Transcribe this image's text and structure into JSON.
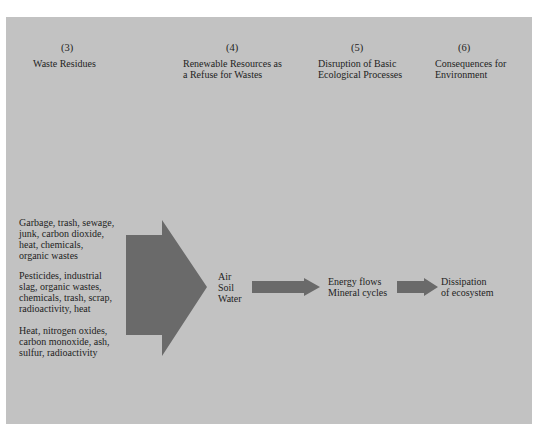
{
  "columns": [
    {
      "number": "(3)",
      "title_lines": [
        "Waste Residues"
      ]
    },
    {
      "number": "(4)",
      "title_lines": [
        "Renewable Resources as",
        "a Refuse for Wastes"
      ]
    },
    {
      "number": "(5)",
      "title_lines": [
        "Disruption of Basic",
        "Ecological Processes"
      ]
    },
    {
      "number": "(6)",
      "title_lines": [
        "Consequences for",
        "Environment"
      ]
    }
  ],
  "waste_groups": [
    "Garbage, trash, sewage,\njunk, carbon dioxide,\nheat, chemicals,\norganic wastes",
    "Pesticides, industrial\nslag, organic wastes,\nchemicals, trash, scrap,\nradioactivity, heat",
    "Heat, nitrogen oxides,\ncarbon monoxide, ash,\nsulfur, radioactivity"
  ],
  "resources": "Air\nSoil\nWater",
  "processes": "Energy flows\nMineral cycles",
  "consequence": "Dissipation\nof ecosystem",
  "colors": {
    "panel": "#c2c2c2",
    "arrow": "#6a6a6a",
    "text": "#1e1e1e"
  }
}
